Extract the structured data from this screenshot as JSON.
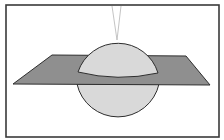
{
  "figure": {
    "colors": {
      "background": "#ffffff",
      "frame": "#3a3a3a",
      "plane_fill": "#8f8f8f",
      "sphere_fill": "#d9d9d9",
      "outline": "#2e2e2e",
      "guide_lines": "#b0b0b0"
    },
    "frame": {
      "x": 6,
      "y": 5,
      "width": 214,
      "height": 133
    },
    "plane": {
      "top_left": [
        52,
        55
      ],
      "top_right": [
        186,
        56
      ],
      "bottom_right": [
        210,
        85
      ],
      "bottom_left": [
        13,
        84
      ]
    },
    "sphere": {
      "cx": 117,
      "cy": 82,
      "r": 42
    },
    "guide_lines": [
      {
        "x1": 112,
        "y1": 6,
        "x2": 117,
        "y2": 40
      },
      {
        "x1": 121,
        "y1": 6,
        "x2": 117,
        "y2": 40
      }
    ]
  }
}
